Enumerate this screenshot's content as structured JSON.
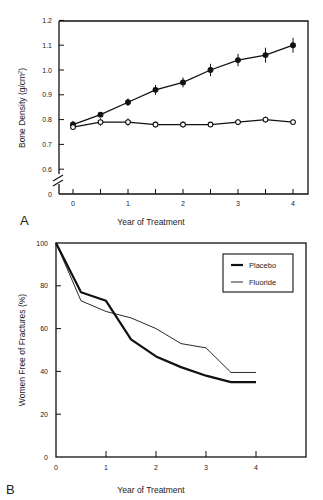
{
  "chart_data": [
    {
      "panel": "A",
      "type": "line",
      "title": "",
      "xlabel": "Year of Treatment",
      "ylabel": "Bone Density (g/cm²)",
      "ylabel_parts": {
        "main": "Bone Density (g/cm",
        "sup": "2",
        "end": ")"
      },
      "x": [
        0,
        0.5,
        1,
        1.5,
        2,
        2.5,
        3,
        3.5,
        4
      ],
      "x_ticks": [
        "0",
        "1",
        "2",
        "3",
        "4"
      ],
      "y_ticks": [
        "0",
        "0.6",
        "0.7",
        "0.8",
        "0.9",
        "1.0",
        "1.1",
        "1.2"
      ],
      "ylim": [
        0.6,
        1.2
      ],
      "axis_break": true,
      "grid": false,
      "series": [
        {
          "name": "Fluoride",
          "marker": "filled-circle",
          "values": [
            0.78,
            0.82,
            0.87,
            0.92,
            0.95,
            1.0,
            1.04,
            1.06,
            1.1
          ],
          "error": [
            0.015,
            0.01,
            0.015,
            0.02,
            0.02,
            0.025,
            0.025,
            0.03,
            0.03
          ]
        },
        {
          "name": "Placebo",
          "marker": "open-circle",
          "values": [
            0.77,
            0.79,
            0.79,
            0.78,
            0.78,
            0.78,
            0.79,
            0.8,
            0.79
          ],
          "error": [
            0.01,
            0.015,
            0.015,
            0.012,
            0.012,
            0.01,
            0.012,
            0.012,
            0.01
          ]
        }
      ]
    },
    {
      "panel": "B",
      "type": "line",
      "title": "",
      "xlabel": "Year of Treatment",
      "ylabel": "Women Free of Fractures (%)",
      "x": [
        0,
        0.5,
        1,
        1.5,
        2,
        2.5,
        3,
        3.5,
        4
      ],
      "x_ticks": [
        "0",
        "1",
        "2",
        "3",
        "4"
      ],
      "y_ticks": [
        "0",
        "20",
        "40",
        "60",
        "80",
        "100"
      ],
      "ylim": [
        0,
        100
      ],
      "grid": false,
      "legend_position": "upper right",
      "series": [
        {
          "name": "Placebo",
          "line": "thick",
          "values": [
            100,
            77,
            73,
            55,
            47,
            42,
            38,
            35,
            35
          ]
        },
        {
          "name": "Fluoride",
          "line": "thin",
          "values": [
            100,
            73,
            68,
            65,
            60,
            53,
            51,
            39.5,
            39.5
          ]
        }
      ]
    }
  ],
  "figure": {
    "panel_a_label": "A",
    "panel_b_label": "B",
    "legend": {
      "placebo": "Placebo",
      "fluoride": "Fluoride"
    }
  }
}
